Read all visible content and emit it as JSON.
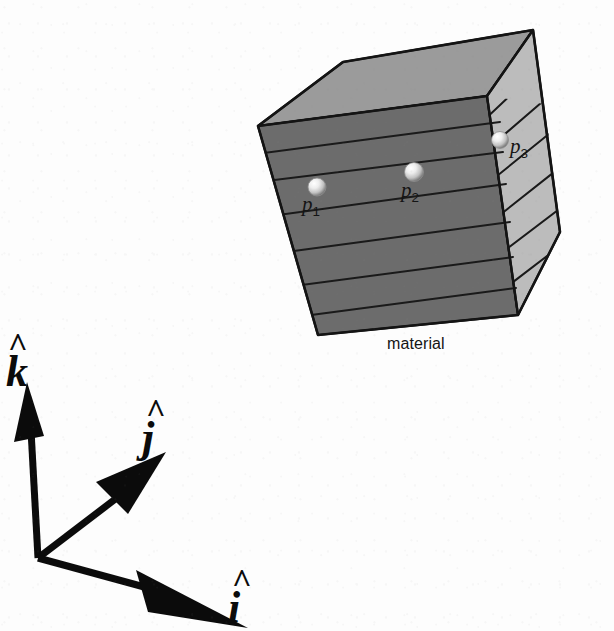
{
  "figure": {
    "background_color": "#fdfdfd",
    "caption": "material"
  },
  "block": {
    "name": "material",
    "caption_label": "material",
    "front_face_color": "#6c6c6c",
    "top_face_color": "#9b9b9b",
    "right_face_color": "#bcbcbc",
    "outline_color": "#141414",
    "layer_line_color": "#1a1a1a",
    "front_layer_count": 7,
    "right_layer_count": 6,
    "description": "Isometric cube subdivided into horizontal material layers"
  },
  "points": [
    {
      "id": "p1",
      "label": "p",
      "subscript": "1",
      "face": "front",
      "x": 317,
      "y": 187
    },
    {
      "id": "p2",
      "label": "p",
      "subscript": "2",
      "face": "front",
      "x": 414,
      "y": 172
    },
    {
      "id": "p3",
      "label": "p",
      "subscript": "3",
      "face": "right",
      "x": 500,
      "y": 140
    }
  ],
  "axes": {
    "origin": {
      "x": 38,
      "y": 558
    },
    "vectors": [
      {
        "id": "k",
        "label": "k",
        "hat": "^",
        "direction": "up",
        "tip_x": 28,
        "tip_y": 388
      },
      {
        "id": "j",
        "label": "j",
        "hat": "^",
        "direction": "upper-right",
        "tip_x": 168,
        "tip_y": 452
      },
      {
        "id": "i",
        "label": "i",
        "hat": "^",
        "direction": "lower-right",
        "tip_x": 250,
        "tip_y": 624
      }
    ],
    "color": "#0b0b0b"
  },
  "sphere": {
    "highlight_color": "#ffffff",
    "mid_color": "#d6d6d6",
    "shadow_color": "#6f6f6f",
    "radius": 9
  }
}
